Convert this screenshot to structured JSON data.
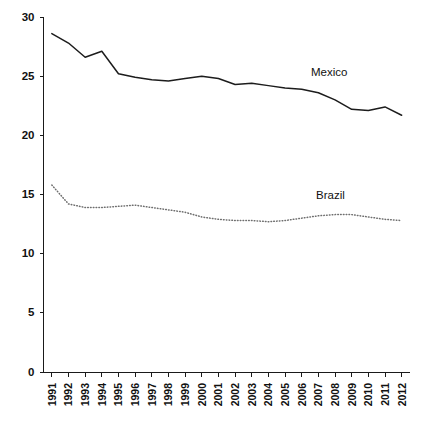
{
  "chart_data": {
    "type": "line",
    "title": "",
    "subtitle": "",
    "xlabel": "",
    "ylabel": "",
    "xlim": [
      1991,
      2012
    ],
    "ylim": [
      0,
      30
    ],
    "yticks": [
      0,
      5,
      10,
      15,
      20,
      25,
      30
    ],
    "grid": false,
    "legend_position": "inline-annotations",
    "categories": [
      "1991",
      "1992",
      "1993",
      "1994",
      "1995",
      "1996",
      "1997",
      "1998",
      "1999",
      "2000",
      "2001",
      "2002",
      "2003",
      "2004",
      "2005",
      "2006",
      "2007",
      "2008",
      "2009",
      "2010",
      "2011",
      "2012"
    ],
    "series": [
      {
        "name": "Mexico",
        "style": "solid",
        "color": "#1c1c1c",
        "label_x": 2007,
        "label_y": 25.4,
        "values": [
          28.6,
          27.8,
          26.6,
          27.1,
          25.2,
          24.9,
          24.7,
          24.6,
          24.8,
          25.0,
          24.8,
          24.3,
          24.4,
          24.2,
          24.0,
          23.9,
          23.6,
          23.0,
          22.2,
          22.1,
          22.4,
          21.7
        ]
      },
      {
        "name": "Brazil",
        "style": "dotted",
        "color": "#6f6f6f",
        "label_x": 2006,
        "label_y": 15.6,
        "values": [
          15.8,
          14.2,
          13.9,
          13.9,
          14.0,
          14.1,
          13.9,
          13.7,
          13.5,
          13.1,
          12.9,
          12.8,
          12.8,
          12.7,
          12.8,
          13.0,
          13.2,
          13.3,
          13.3,
          13.1,
          12.9,
          12.8
        ]
      }
    ],
    "annotations": [
      {
        "text": "Mexico",
        "x_px": 311,
        "y_px": 76
      },
      {
        "text": "Brazil",
        "x_px": 316,
        "y_px": 199
      }
    ]
  }
}
